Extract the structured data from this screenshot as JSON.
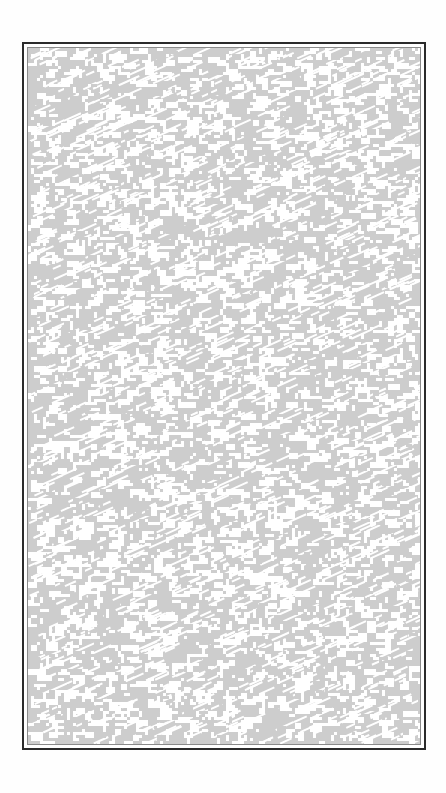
{
  "page": {
    "background_color": "#ffffff"
  },
  "frame": {
    "outer_border_color": "#2b2b2b",
    "inner_border_color": "#8a8a8a"
  },
  "pattern": {
    "description": "noise-texture",
    "base_color": "#cdcdcd",
    "dash_color": "#ffffff",
    "orientation": "diagonal"
  }
}
